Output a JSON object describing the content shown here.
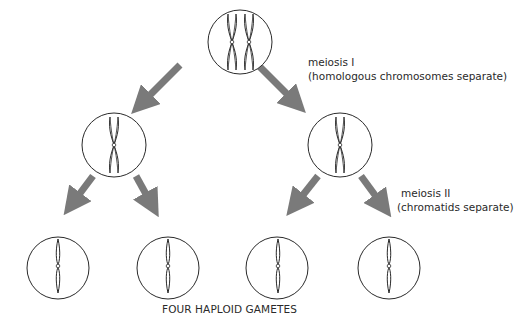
{
  "diagram": {
    "colors": {
      "arrow": "#7a7a7a",
      "outline": "#2a2a2a",
      "text": "#2a2a2a",
      "background": "#ffffff"
    },
    "stages": [
      {
        "id": "parent-cell",
        "cx": 240,
        "cy": 42,
        "r": 32,
        "chromosomes": "two homologous pairs (X-shaped)"
      },
      {
        "id": "meiosis1-left",
        "cx": 114,
        "cy": 145,
        "r": 32,
        "chromosomes": "one X-shaped chromosome"
      },
      {
        "id": "meiosis1-right",
        "cx": 340,
        "cy": 145,
        "r": 32,
        "chromosomes": "one X-shaped chromosome"
      },
      {
        "id": "gamete-1",
        "cx": 58,
        "cy": 268,
        "r": 31,
        "chromosomes": "single chromatid"
      },
      {
        "id": "gamete-2",
        "cx": 168,
        "cy": 268,
        "r": 31,
        "chromosomes": "single chromatid"
      },
      {
        "id": "gamete-3",
        "cx": 277,
        "cy": 268,
        "r": 31,
        "chromosomes": "single chromatid"
      },
      {
        "id": "gamete-4",
        "cx": 389,
        "cy": 268,
        "r": 31,
        "chromosomes": "single chromatid"
      }
    ],
    "labels": {
      "meiosis1_title": "meiosis I",
      "meiosis1_desc": "(homologous chromosomes separate)",
      "meiosis2_title": "meiosis II",
      "meiosis2_desc": "(chromatids separate)",
      "gametes_caption": "FOUR HAPLOID GAMETES"
    }
  }
}
